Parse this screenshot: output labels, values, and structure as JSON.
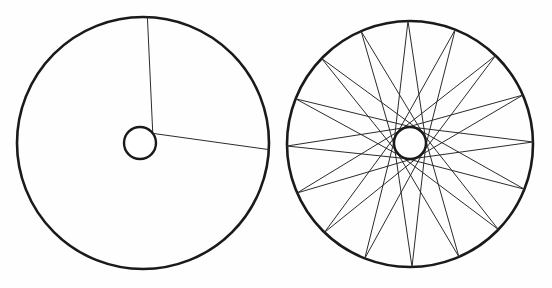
{
  "figure": {
    "background_color": "#fefefe",
    "width": 552,
    "height": 288,
    "stroke_color": "#1a1a1a",
    "spoke_color": "#2b2b2b",
    "hub_fill": "#ffffff"
  },
  "chart_data": {
    "type": "diagram",
    "xlabel": "",
    "ylabel": "",
    "panels": [
      {
        "name": "left-wheel",
        "label": "",
        "description": "Wheel rim with hub and two tangential spokes shown",
        "rim": {
          "cx": 143,
          "cy": 143,
          "r": 126,
          "stroke_width": 2.6
        },
        "hub": {
          "cx": 140,
          "cy": 143,
          "r": 16,
          "stroke_width": 2.4
        },
        "spoke_count": 2,
        "spoke_style": "tangential-chord",
        "spokes": [
          {
            "index": 0,
            "hub_tangent_angle_deg": -37,
            "rim_angle_deg": -88,
            "lacing": "leading"
          },
          {
            "index": 1,
            "hub_tangent_angle_deg": -37,
            "rim_angle_deg": 3,
            "lacing": "trailing"
          }
        ]
      },
      {
        "name": "right-wheel",
        "label": "",
        "description": "Complete wheel with full set of tangentially laced spokes",
        "rim": {
          "cx": 410,
          "cy": 144,
          "r": 123,
          "stroke_width": 2.6
        },
        "hub": {
          "cx": 410,
          "cy": 143,
          "r": 16,
          "stroke_width": 2.4
        },
        "spoke_count": 32,
        "spoke_style": "tangential-chord",
        "spoke_pairs": 16,
        "cross_pattern": "3-cross",
        "hub_flange_step_deg": 22.5,
        "rim_step_deg": 11.25
      }
    ]
  }
}
